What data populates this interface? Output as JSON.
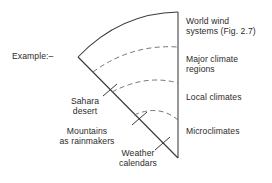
{
  "figure": {
    "example_label": "Example:–"
  },
  "scale_labels": [
    {
      "id": "world-wind",
      "text": "World wind\nsystems (Fig. 2.7)"
    },
    {
      "id": "major-climate",
      "text": "Major climate\nregions"
    },
    {
      "id": "local-climates",
      "text": "Local climates"
    },
    {
      "id": "microclimates",
      "text": "Microclimates"
    }
  ],
  "example_labels": [
    {
      "id": "sahara",
      "text": "Sahara\ndesert"
    },
    {
      "id": "mountains",
      "text": "Mountains\nas rainmakers"
    },
    {
      "id": "weather",
      "text": "Weather\ncalendars"
    }
  ],
  "colors": {
    "ink": "#2b2b2b",
    "line": "#3a3a3a",
    "dash": "#6f6f6f",
    "background": "#ffffff"
  }
}
